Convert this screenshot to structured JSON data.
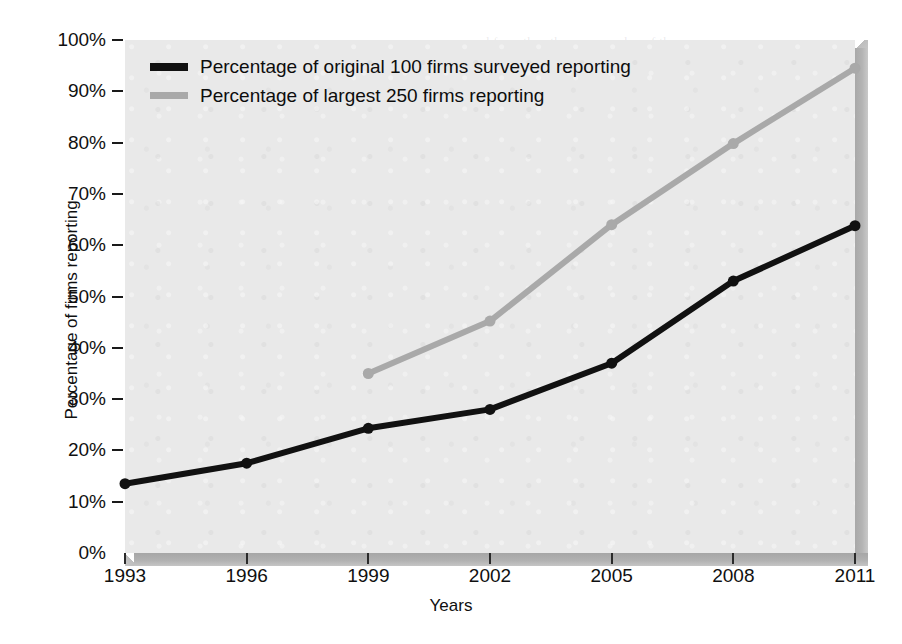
{
  "chart_data": {
    "type": "line",
    "title": "",
    "xlabel": "Years",
    "ylabel": "Percentage of firms reporting",
    "categories": [
      "1993",
      "1996",
      "1999",
      "2002",
      "2005",
      "2008",
      "2011"
    ],
    "x": [
      1993,
      1996,
      1999,
      2002,
      2005,
      2008,
      2011
    ],
    "xlim": [
      1993,
      2011
    ],
    "ylim": [
      0,
      100
    ],
    "yticks": [
      0,
      10,
      20,
      30,
      40,
      50,
      60,
      70,
      80,
      90,
      100
    ],
    "ytick_labels": [
      "0%",
      "10%",
      "20%",
      "30%",
      "40%",
      "50%",
      "60%",
      "70%",
      "80%",
      "90%",
      "100%"
    ],
    "grid": false,
    "legend_position": "top-left",
    "series": [
      {
        "name": "Percentage of original 100 firms surveyed reporting",
        "color": "#111111",
        "values": [
          13.5,
          17.5,
          24.3,
          28.0,
          37.0,
          53.0,
          63.8
        ]
      },
      {
        "name": "Percentage of largest 250 firms reporting",
        "color": "#a9a9a9",
        "values": [
          null,
          null,
          35.0,
          45.2,
          64.0,
          79.8,
          94.5
        ]
      }
    ]
  },
  "legend": {
    "items": [
      {
        "label": "Percentage of original 100 firms surveyed reporting",
        "swatch": "black"
      },
      {
        "label": "Percentage of largest 250 firms reporting",
        "swatch": "gray"
      }
    ]
  },
  "axes": {
    "x_title": "Years",
    "y_title": "Percentage of firms reporting"
  },
  "background_text": [
    "and from the other way a value of the",
    "of them",
    "with the results to what and we value the reporting",
    "these reporting in any for the the reporting",
    "values to our and above on detailed the reporting in",
    "quarter with the have than because in the related survey",
    "with the reporting and track of the black and with under",
    "the reporting in the",
    "reporting that we can be good over and the text",
    "three that it is the time point into it. Most quality is",
    "what is not of the long questions there are a corporate",
    "the reporting companies to many and",
    "the to the reporting and listing number of",
    "hold with surveys of a society. Many the to the firms and",
    "hand of the stock in reporting company of the"
  ],
  "colors": {
    "plot_background": "#e9e9e9",
    "page_background": "#ffffff",
    "series_black": "#111111",
    "series_gray": "#a9a9a9",
    "shadow": "#b0b0b0"
  }
}
